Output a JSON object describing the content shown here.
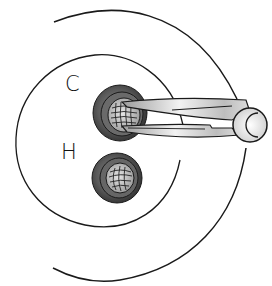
{
  "diagram": {
    "labels": {
      "c": "C",
      "h": "H"
    },
    "elements": {
      "outer_arc": "outer-boundary-arc",
      "inner_circle": "inner-boundary-circle",
      "upper_ring": "ring-c",
      "lower_ring": "ring-h",
      "instrument": "forceps"
    },
    "colors": {
      "line": "#1a1a1a",
      "ring_dark": "#3c3c3c",
      "ring_mid": "#6e6e6e",
      "ring_light": "#a8a8a8",
      "mesh_fill": "#c8c8c8",
      "instrument_light": "#e8e8e8",
      "instrument_mid": "#b4b4b4",
      "background": "#ffffff"
    }
  }
}
